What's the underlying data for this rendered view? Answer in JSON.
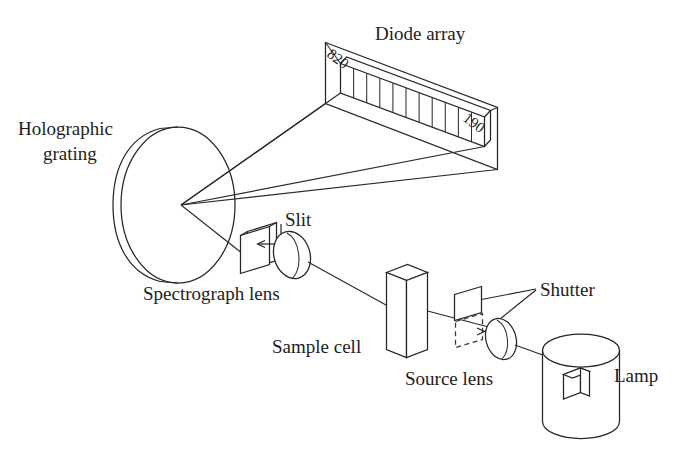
{
  "figure": {
    "background_color": "#ffffff",
    "line_color": "#262626",
    "labels": {
      "diode_array": "Diode array",
      "holographic_grating_line1": "Holographic",
      "holographic_grating_line2": "grating",
      "slit": "Slit",
      "spectrograph_lens": "Spectrograph lens",
      "sample_cell": "Sample cell",
      "shutter": "Shutter",
      "source_lens": "Source lens",
      "lamp": "Lamp"
    },
    "wavelength_ticks": {
      "left": "820",
      "right": "190"
    },
    "diode_array": {
      "segment_count": 11
    },
    "components": [
      "Lamp",
      "Source lens",
      "Shutter",
      "Sample cell",
      "Spectrograph lens",
      "Slit",
      "Holographic grating",
      "Diode array"
    ]
  }
}
